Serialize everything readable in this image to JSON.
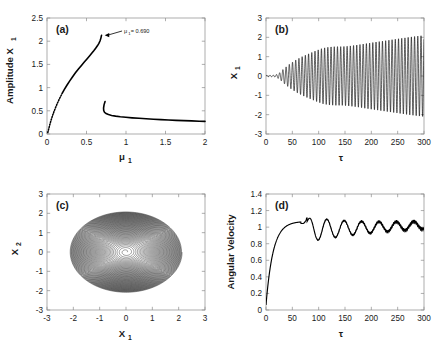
{
  "figure": {
    "background": "#ffffff",
    "ink": "#000000",
    "axis_color": "#9a9a9a",
    "panel_count": 4
  },
  "chart_data": [
    {
      "type": "line",
      "panel": "a",
      "tag": "(a)",
      "title": "",
      "xlabel": "μ",
      "xlabel_sub": "1",
      "ylabel": "Amplitude X",
      "ylabel_sub": "1",
      "xlim": [
        0,
        2
      ],
      "ylim": [
        0,
        2.5
      ],
      "xticks": [
        0,
        0.5,
        1,
        1.5,
        2
      ],
      "xtick_labels": [
        "0",
        "0.5",
        "1",
        "1.5",
        "2"
      ],
      "yticks": [
        0,
        0.5,
        1,
        1.5,
        2,
        2.5
      ],
      "ytick_labels": [
        "0",
        "0.5",
        "1",
        "1.5",
        "2",
        "2.5"
      ],
      "grid": false,
      "legend": "none",
      "annotation": {
        "text": "= 0.690",
        "symbol": "μ",
        "symbol_sub": "1",
        "arrow_from_x": 0.95,
        "arrow_from_y": 2.22,
        "arrow_to_x": 0.73,
        "arrow_to_y": 2.13
      },
      "series": [
        {
          "name": "upper-branch",
          "style": "dotted-to-solid",
          "points_x": [
            0.01,
            0.022,
            0.036,
            0.052,
            0.07,
            0.09,
            0.112,
            0.136,
            0.162,
            0.19,
            0.22,
            0.252,
            0.286,
            0.322,
            0.36,
            0.398,
            0.436,
            0.472,
            0.506,
            0.538,
            0.566,
            0.592,
            0.616,
            0.638,
            0.657,
            0.672,
            0.683,
            0.69
          ],
          "points_y": [
            0.03,
            0.11,
            0.205,
            0.3,
            0.395,
            0.49,
            0.585,
            0.68,
            0.775,
            0.868,
            0.96,
            1.05,
            1.14,
            1.228,
            1.318,
            1.4,
            1.478,
            1.55,
            1.618,
            1.682,
            1.74,
            1.795,
            1.848,
            1.9,
            1.952,
            2.01,
            2.072,
            2.125
          ]
        },
        {
          "name": "lower-branch",
          "style": "solid",
          "points_x": [
            0.735,
            0.722,
            0.716,
            0.718,
            0.728,
            0.748,
            0.778,
            0.818,
            0.868,
            0.928,
            0.998,
            1.078,
            1.165,
            1.255,
            1.348,
            1.442,
            1.538,
            1.635,
            1.732,
            1.83,
            1.928,
            2.0
          ],
          "points_y": [
            0.7,
            0.628,
            0.56,
            0.505,
            0.468,
            0.44,
            0.418,
            0.4,
            0.385,
            0.372,
            0.36,
            0.348,
            0.338,
            0.328,
            0.318,
            0.31,
            0.302,
            0.294,
            0.288,
            0.282,
            0.276,
            0.272
          ]
        }
      ]
    },
    {
      "type": "line",
      "panel": "b",
      "tag": "(b)",
      "xlabel": "τ",
      "ylabel": "X",
      "ylabel_sub": "1",
      "xlim": [
        0,
        300
      ],
      "ylim": [
        -3,
        3
      ],
      "xticks": [
        0,
        50,
        100,
        150,
        200,
        250,
        300
      ],
      "xtick_labels": [
        "0",
        "50",
        "100",
        "150",
        "200",
        "250",
        "300"
      ],
      "yticks": [
        -3,
        -2,
        -1,
        0,
        1,
        2,
        3
      ],
      "ytick_labels": [
        "-3",
        "-2",
        "-1",
        "0",
        "1",
        "2",
        "3"
      ],
      "grid": false,
      "legend": "none",
      "description": "growing self-excited oscillation reaching amplitude about 2.1 at tau=300",
      "oscillation": {
        "period": 6.1,
        "growth_onset": 22,
        "envelope_x": [
          0,
          18,
          26,
          34,
          45,
          58,
          70,
          82,
          95,
          108,
          120,
          132,
          145,
          158,
          172,
          186,
          200,
          215,
          230,
          245,
          260,
          275,
          290,
          300
        ],
        "envelope_y": [
          0.03,
          0.05,
          0.17,
          0.38,
          0.62,
          0.85,
          1.02,
          1.16,
          1.31,
          1.44,
          1.5,
          1.52,
          1.52,
          1.55,
          1.6,
          1.66,
          1.72,
          1.78,
          1.84,
          1.9,
          1.96,
          2.02,
          2.07,
          2.1
        ]
      }
    },
    {
      "type": "line",
      "panel": "c",
      "tag": "(c)",
      "xlabel": "X",
      "xlabel_sub": "1",
      "ylabel": "X",
      "ylabel_sub": "2",
      "xlim": [
        -3,
        3
      ],
      "ylim": [
        -3,
        3
      ],
      "xticks": [
        -3,
        -2,
        -1,
        0,
        1,
        2,
        3
      ],
      "xtick_labels": [
        "-3",
        "-2",
        "-1",
        "0",
        "1",
        "2",
        "3"
      ],
      "yticks": [
        -3,
        -2,
        -1,
        0,
        1,
        2,
        3
      ],
      "ytick_labels": [
        "-3",
        "-2",
        "-1",
        "0",
        "1",
        "2",
        "3"
      ],
      "grid": false,
      "legend": "none",
      "description": "phase portrait: outward spiral from origin onto a limit cycle",
      "spiral": {
        "turns": 56,
        "r_start": 0.035,
        "r_end": 2.13,
        "x_scale": 1.0,
        "y_scale": 0.98,
        "growth_shape": 0.62
      }
    },
    {
      "type": "line",
      "panel": "d",
      "tag": "(d)",
      "xlabel": "τ",
      "ylabel": "Angular Velocity",
      "xlim": [
        0,
        300
      ],
      "ylim": [
        0,
        1.4
      ],
      "xticks": [
        0,
        50,
        100,
        150,
        200,
        250,
        300
      ],
      "xtick_labels": [
        "0",
        "50",
        "100",
        "150",
        "200",
        "250",
        "300"
      ],
      "yticks": [
        0,
        0.2,
        0.4,
        0.6,
        0.8,
        1.0,
        1.2,
        1.4
      ],
      "ytick_labels": [
        "0",
        "0.2",
        "0.4",
        "0.6",
        "0.8",
        "1",
        "1.2",
        "1.4"
      ],
      "grid": false,
      "legend": "none",
      "description": "angular velocity rises to 1.07 near tau=50, dips to 0.81 near tau=100, then damped oscillations settle near 1.0",
      "rise": {
        "start_value": 0.06,
        "time_constant": 13.5,
        "peak_value": 1.07,
        "peak_time": 50
      },
      "ripple": {
        "onset": 78,
        "period": 33,
        "amp_start": 0.175,
        "amp_end": 0.035,
        "decay": 95,
        "mean_start": 0.965,
        "mean_end": 1.015,
        "band_thickness_start": 0.006,
        "band_thickness_end": 0.028
      }
    }
  ]
}
